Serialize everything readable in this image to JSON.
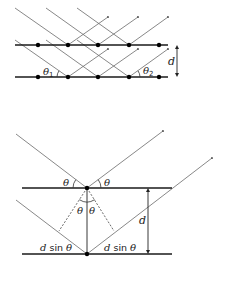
{
  "figure": {
    "top_diagram": {
      "description": "Two crystal lattice planes with parallel incident and reflected X-ray beams",
      "labels": {
        "theta1": "θ",
        "theta1_sub": "1",
        "theta2": "θ",
        "theta2_sub": "2",
        "spacing": "d"
      },
      "atom_count_per_plane": 5
    },
    "bottom_diagram": {
      "description": "Bragg reflection geometry showing path difference 2d sin θ",
      "labels": {
        "theta_left_incident": "θ",
        "theta_right_reflected": "θ",
        "theta_inner_left": "θ",
        "theta_inner_right": "θ",
        "spacing": "d",
        "path_left_d": "d",
        "path_left_sin": " sin ",
        "path_left_theta": "θ",
        "path_right_d": "d",
        "path_right_sin": " sin ",
        "path_right_theta": "θ"
      }
    }
  }
}
